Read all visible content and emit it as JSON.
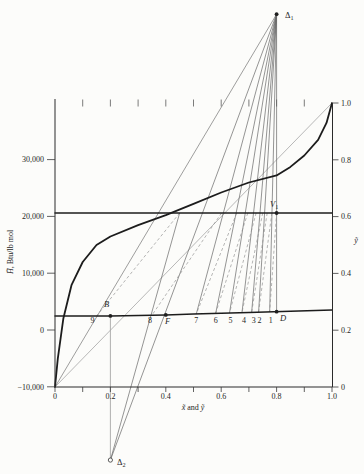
{
  "figure": {
    "background": "#fcfcfa",
    "ink": "#1f1f1f",
    "curve_color": "#1c1c1c",
    "construction_color": "#676767",
    "light_color": "#a6a6a6",
    "tie_color": "#8c8c8c"
  },
  "chart_data": {
    "type": "line",
    "xlabel_parts": [
      {
        "t": "x̃",
        "i": 1
      },
      {
        "t": " and ",
        "i": 0
      },
      {
        "t": "ỹ",
        "i": 1
      }
    ],
    "ylabel_left_parts": [
      {
        "t": "H̃",
        "i": 1
      },
      {
        "t": ", Btu/lb mol",
        "i": 0
      }
    ],
    "ylabel_right_parts": [
      {
        "t": "ỹ",
        "i": 1
      }
    ],
    "xlim": [
      0,
      1.0
    ],
    "ylim_left": [
      -10000,
      40000
    ],
    "ylim_right": [
      0,
      1.0
    ],
    "grid": false,
    "x_ticks_labeled": [
      0,
      0.2,
      0.4,
      0.6,
      0.8,
      1.0
    ],
    "x_tick_labels": [
      "0",
      "0.2",
      "0.4",
      "0.6",
      "0.8",
      "1.0"
    ],
    "x_minor_tick_step": 0.1,
    "left_ticks": [
      -10000,
      0,
      10000,
      20000,
      30000
    ],
    "left_tick_labels": [
      "−10,000",
      "0",
      "10,000",
      "20,000",
      "30,000"
    ],
    "right_ticks": [
      0,
      0.2,
      0.4,
      0.6,
      0.8,
      1.0
    ],
    "right_tick_labels": [
      "0",
      "0.2",
      "0.4",
      "0.6",
      "0.8",
      "1.0"
    ],
    "series": [
      {
        "name": "equilibrium-curve",
        "axis": "right",
        "x": [
          0,
          0.01,
          0.03,
          0.06,
          0.1,
          0.15,
          0.2,
          0.3,
          0.4,
          0.5,
          0.6,
          0.7,
          0.8,
          0.85,
          0.9,
          0.95,
          0.98,
          1.0
        ],
        "y": [
          0,
          0.1,
          0.24,
          0.36,
          0.44,
          0.5,
          0.53,
          0.57,
          0.605,
          0.645,
          0.685,
          0.72,
          0.745,
          0.775,
          0.815,
          0.87,
          0.93,
          1.0
        ]
      },
      {
        "name": "diagonal-reference-line",
        "axis": "right",
        "x": [
          0,
          1.0
        ],
        "y": [
          0,
          1.0
        ]
      },
      {
        "name": "saturated-vapor-enthalpy-line",
        "axis": "left",
        "H_const": 20600
      },
      {
        "name": "saturated-liquid-enthalpy-curve",
        "axis": "left",
        "x": [
          0,
          0.1,
          0.2,
          0.3,
          0.4,
          0.5,
          0.6,
          0.7,
          0.85,
          1.0
        ],
        "H": [
          2450,
          2460,
          2480,
          2550,
          2650,
          2800,
          2950,
          3100,
          3300,
          3520
        ]
      }
    ],
    "stages": [
      {
        "n": "1",
        "x": 0.775,
        "y": 0.8,
        "dx": 1
      },
      {
        "n": "2",
        "x": 0.735,
        "y": 0.783,
        "dx": 1
      },
      {
        "n": "3",
        "x": 0.71,
        "y": 0.766,
        "dx": 2
      },
      {
        "n": "4",
        "x": 0.675,
        "y": 0.75,
        "dx": 2
      },
      {
        "n": "5",
        "x": 0.63,
        "y": 0.726,
        "dx": 1
      },
      {
        "n": "6",
        "x": 0.58,
        "y": 0.696,
        "dx": 0
      },
      {
        "n": "7",
        "x": 0.51,
        "y": 0.656,
        "dx": 0
      },
      {
        "n": "8",
        "x": 0.35,
        "y": 0.601,
        "dx": -2
      },
      {
        "n": "9",
        "x": 0.15,
        "y": 0.45,
        "dx": -4
      }
    ],
    "delta1_rays_to_stages": [
      1,
      2,
      3,
      4,
      5,
      6,
      7
    ],
    "delta2_ray_to_vapor_of_stage": 9,
    "points": {
      "delta1": {
        "base": "Δ",
        "sub": "1",
        "x": 0.8,
        "H": 55600,
        "marker": "dot",
        "lx": 285,
        "ly": 18
      },
      "delta2": {
        "base": "Δ",
        "sub": "2",
        "x": 0.2,
        "H": -22900,
        "marker": "open",
        "lx": 117,
        "ly": 465
      },
      "V1": {
        "base": "V",
        "sub": "1",
        "italic": true,
        "x": 0.8,
        "H": 20600,
        "marker": "dot",
        "lx": 270,
        "ly": 207
      },
      "D": {
        "base": "D",
        "italic": true,
        "x": 0.8,
        "on": "liquid",
        "marker": "dot",
        "lx": 280,
        "ly": 321
      },
      "F": {
        "base": "F",
        "italic": true,
        "x": 0.4,
        "on": "liquid",
        "marker": "dot",
        "lx": 165,
        "ly": 324
      },
      "B": {
        "base": "B",
        "italic": true,
        "x": 0.2,
        "on": "liquid",
        "marker": "dot",
        "lx": 104,
        "ly": 307
      }
    }
  }
}
